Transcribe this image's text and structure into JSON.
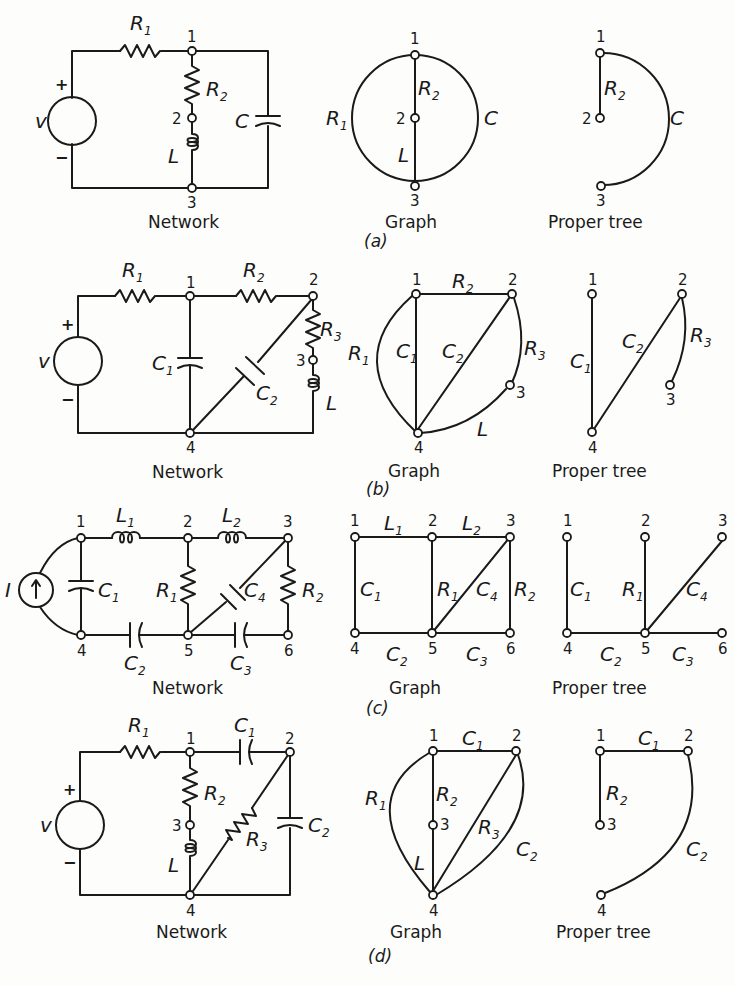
{
  "figure": {
    "parts": [
      {
        "id": "a",
        "part_label": "(a)",
        "network": {
          "caption": "Network",
          "source": {
            "type": "voltage",
            "label": "v",
            "plus": "+",
            "minus": "−"
          },
          "elements": [
            {
              "name": "R1",
              "base": "R",
              "sub": "1",
              "from": "src",
              "to": "1",
              "type": "resistor"
            },
            {
              "name": "R2",
              "base": "R",
              "sub": "2",
              "from": "1",
              "to": "2",
              "type": "resistor"
            },
            {
              "name": "L",
              "base": "L",
              "sub": "",
              "from": "2",
              "to": "3",
              "type": "inductor"
            },
            {
              "name": "C",
              "base": "C",
              "sub": "",
              "from": "1",
              "to": "3",
              "type": "capacitor"
            }
          ],
          "nodes": [
            "1",
            "2",
            "3"
          ]
        },
        "graph": {
          "caption": "Graph",
          "edges": [
            {
              "label_base": "R",
              "label_sub": "1",
              "from": "1",
              "to": "3"
            },
            {
              "label_base": "R",
              "label_sub": "2",
              "from": "1",
              "to": "2"
            },
            {
              "label_base": "L",
              "label_sub": "",
              "from": "2",
              "to": "3"
            },
            {
              "label_base": "C",
              "label_sub": "",
              "from": "1",
              "to": "3"
            }
          ],
          "nodes": [
            "1",
            "2",
            "3"
          ]
        },
        "tree": {
          "caption": "Proper tree",
          "edges": [
            {
              "label_base": "R",
              "label_sub": "2",
              "from": "1",
              "to": "2"
            },
            {
              "label_base": "C",
              "label_sub": "",
              "from": "1",
              "to": "3"
            }
          ],
          "nodes": [
            "1",
            "2",
            "3"
          ]
        }
      },
      {
        "id": "b",
        "part_label": "(b)",
        "network": {
          "caption": "Network",
          "source": {
            "type": "voltage",
            "label": "v",
            "plus": "+",
            "minus": "−"
          },
          "elements": [
            {
              "name": "R1",
              "base": "R",
              "sub": "1",
              "from": "src",
              "to": "1",
              "type": "resistor"
            },
            {
              "name": "R2",
              "base": "R",
              "sub": "2",
              "from": "1",
              "to": "2",
              "type": "resistor"
            },
            {
              "name": "R3",
              "base": "R",
              "sub": "3",
              "from": "2",
              "to": "3",
              "type": "resistor"
            },
            {
              "name": "L",
              "base": "L",
              "sub": "",
              "from": "3",
              "to": "4",
              "type": "inductor"
            },
            {
              "name": "C1",
              "base": "C",
              "sub": "1",
              "from": "1",
              "to": "4",
              "type": "capacitor"
            },
            {
              "name": "C2",
              "base": "C",
              "sub": "2",
              "from": "2",
              "to": "4",
              "type": "capacitor"
            }
          ],
          "nodes": [
            "1",
            "2",
            "3",
            "4"
          ]
        },
        "graph": {
          "caption": "Graph",
          "edges": [
            {
              "label_base": "R",
              "label_sub": "1",
              "from": "1",
              "to": "4"
            },
            {
              "label_base": "R",
              "label_sub": "2",
              "from": "1",
              "to": "2"
            },
            {
              "label_base": "C",
              "label_sub": "1",
              "from": "1",
              "to": "4"
            },
            {
              "label_base": "C",
              "label_sub": "2",
              "from": "2",
              "to": "4"
            },
            {
              "label_base": "R",
              "label_sub": "3",
              "from": "2",
              "to": "3"
            },
            {
              "label_base": "L",
              "label_sub": "",
              "from": "3",
              "to": "4"
            }
          ],
          "nodes": [
            "1",
            "2",
            "3",
            "4"
          ]
        },
        "tree": {
          "caption": "Proper tree",
          "edges": [
            {
              "label_base": "C",
              "label_sub": "1",
              "from": "1",
              "to": "4"
            },
            {
              "label_base": "C",
              "label_sub": "2",
              "from": "2",
              "to": "4"
            },
            {
              "label_base": "R",
              "label_sub": "3",
              "from": "2",
              "to": "3"
            }
          ],
          "nodes": [
            "1",
            "2",
            "3",
            "4"
          ]
        }
      },
      {
        "id": "c",
        "part_label": "(c)",
        "network": {
          "caption": "Network",
          "source": {
            "type": "current",
            "label": "I"
          },
          "elements": [
            {
              "name": "L1",
              "base": "L",
              "sub": "1",
              "from": "1",
              "to": "2",
              "type": "inductor"
            },
            {
              "name": "L2",
              "base": "L",
              "sub": "2",
              "from": "2",
              "to": "3",
              "type": "inductor"
            },
            {
              "name": "C1",
              "base": "C",
              "sub": "1",
              "from": "1",
              "to": "4",
              "type": "capacitor"
            },
            {
              "name": "R1",
              "base": "R",
              "sub": "1",
              "from": "2",
              "to": "5",
              "type": "resistor"
            },
            {
              "name": "C4",
              "base": "C",
              "sub": "4",
              "from": "3",
              "to": "5",
              "type": "capacitor"
            },
            {
              "name": "R2",
              "base": "R",
              "sub": "2",
              "from": "3",
              "to": "6",
              "type": "resistor"
            },
            {
              "name": "C2",
              "base": "C",
              "sub": "2",
              "from": "4",
              "to": "5",
              "type": "capacitor"
            },
            {
              "name": "C3",
              "base": "C",
              "sub": "3",
              "from": "5",
              "to": "6",
              "type": "capacitor"
            }
          ],
          "nodes": [
            "1",
            "2",
            "3",
            "4",
            "5",
            "6"
          ]
        },
        "graph": {
          "caption": "Graph",
          "edges": [
            {
              "label_base": "L",
              "label_sub": "1",
              "from": "1",
              "to": "2"
            },
            {
              "label_base": "L",
              "label_sub": "2",
              "from": "2",
              "to": "3"
            },
            {
              "label_base": "C",
              "label_sub": "1",
              "from": "1",
              "to": "4"
            },
            {
              "label_base": "R",
              "label_sub": "1",
              "from": "2",
              "to": "5"
            },
            {
              "label_base": "C",
              "label_sub": "4",
              "from": "3",
              "to": "5"
            },
            {
              "label_base": "R",
              "label_sub": "2",
              "from": "3",
              "to": "6"
            },
            {
              "label_base": "C",
              "label_sub": "2",
              "from": "4",
              "to": "5"
            },
            {
              "label_base": "C",
              "label_sub": "3",
              "from": "5",
              "to": "6"
            }
          ],
          "nodes": [
            "1",
            "2",
            "3",
            "4",
            "5",
            "6"
          ]
        },
        "tree": {
          "caption": "Proper tree",
          "edges": [
            {
              "label_base": "C",
              "label_sub": "1",
              "from": "1",
              "to": "4"
            },
            {
              "label_base": "R",
              "label_sub": "1",
              "from": "2",
              "to": "5"
            },
            {
              "label_base": "C",
              "label_sub": "4",
              "from": "3",
              "to": "5"
            },
            {
              "label_base": "C",
              "label_sub": "2",
              "from": "4",
              "to": "5"
            },
            {
              "label_base": "C",
              "label_sub": "3",
              "from": "5",
              "to": "6"
            }
          ],
          "nodes": [
            "1",
            "2",
            "3",
            "4",
            "5",
            "6"
          ]
        }
      },
      {
        "id": "d",
        "part_label": "(d)",
        "network": {
          "caption": "Network",
          "source": {
            "type": "voltage",
            "label": "v",
            "plus": "+",
            "minus": "−"
          },
          "elements": [
            {
              "name": "R1",
              "base": "R",
              "sub": "1",
              "from": "src",
              "to": "1",
              "type": "resistor"
            },
            {
              "name": "C1",
              "base": "C",
              "sub": "1",
              "from": "1",
              "to": "2",
              "type": "capacitor"
            },
            {
              "name": "R2",
              "base": "R",
              "sub": "2",
              "from": "1",
              "to": "3",
              "type": "resistor"
            },
            {
              "name": "L",
              "base": "L",
              "sub": "",
              "from": "3",
              "to": "4",
              "type": "inductor"
            },
            {
              "name": "R3",
              "base": "R",
              "sub": "3",
              "from": "2",
              "to": "4",
              "type": "resistor"
            },
            {
              "name": "C2",
              "base": "C",
              "sub": "2",
              "from": "2",
              "to": "4",
              "type": "capacitor"
            }
          ],
          "nodes": [
            "1",
            "2",
            "3",
            "4"
          ]
        },
        "graph": {
          "caption": "Graph",
          "edges": [
            {
              "label_base": "R",
              "label_sub": "1",
              "from": "1",
              "to": "4"
            },
            {
              "label_base": "C",
              "label_sub": "1",
              "from": "1",
              "to": "2"
            },
            {
              "label_base": "R",
              "label_sub": "2",
              "from": "1",
              "to": "3"
            },
            {
              "label_base": "L",
              "label_sub": "",
              "from": "3",
              "to": "4"
            },
            {
              "label_base": "R",
              "label_sub": "3",
              "from": "2",
              "to": "4"
            },
            {
              "label_base": "C",
              "label_sub": "2",
              "from": "2",
              "to": "4"
            }
          ],
          "nodes": [
            "1",
            "2",
            "3",
            "4"
          ]
        },
        "tree": {
          "caption": "Proper tree",
          "edges": [
            {
              "label_base": "C",
              "label_sub": "1",
              "from": "1",
              "to": "2"
            },
            {
              "label_base": "R",
              "label_sub": "2",
              "from": "1",
              "to": "3"
            },
            {
              "label_base": "C",
              "label_sub": "2",
              "from": "2",
              "to": "4"
            }
          ],
          "nodes": [
            "1",
            "2",
            "3",
            "4"
          ]
        }
      }
    ],
    "labels": {
      "n1": "1",
      "n2": "2",
      "n3": "3",
      "n4": "4",
      "n5": "5",
      "n6": "6",
      "R": "R",
      "L": "L",
      "C": "C",
      "I": "I",
      "v": "v",
      "s1": "1",
      "s2": "2",
      "s3": "3",
      "s4": "4",
      "plus": "+",
      "minus": "−"
    },
    "colors": {
      "ink": "#1a1a1a",
      "paper": "#fdfdfb"
    }
  }
}
